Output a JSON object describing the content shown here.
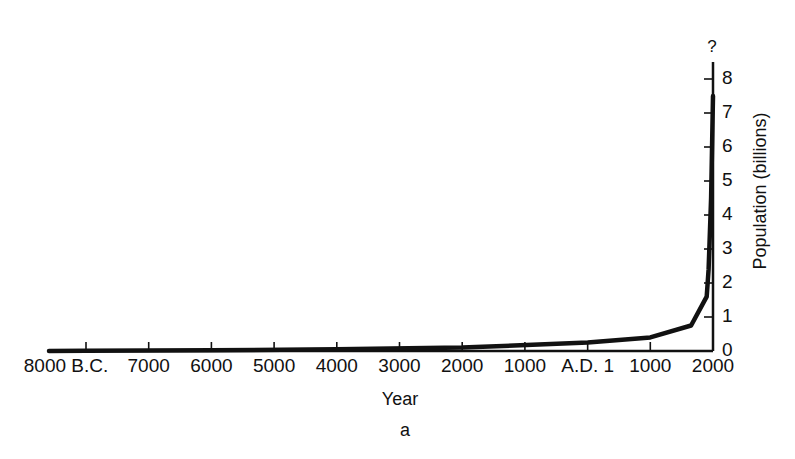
{
  "chart_data": {
    "type": "line",
    "title": "",
    "xlabel": "Year",
    "ylabel": "Population (billions)",
    "caption": "a",
    "annotation": "?",
    "x_tick_labels": [
      "8000 B.C.",
      "7000",
      "6000",
      "5000",
      "4000",
      "3000",
      "2000",
      "1000",
      "A.D. 1",
      "1000",
      "2000"
    ],
    "x_tick_values": [
      -8000,
      -7000,
      -6000,
      -5000,
      -4000,
      -3000,
      -2000,
      -1000,
      1,
      1000,
      2000
    ],
    "y_tick_labels": [
      "0",
      "1",
      "2",
      "3",
      "4",
      "5",
      "6",
      "7",
      "8"
    ],
    "ylim": [
      0,
      8.5
    ],
    "xlim": [
      -8600,
      2000
    ],
    "y_axis_position": "right",
    "grid": false,
    "legend": null,
    "series": [
      {
        "name": "World population",
        "x": [
          -8600,
          -8000,
          -6000,
          -4000,
          -2000,
          1,
          1000,
          1650,
          1900,
          1930,
          1970,
          2000
        ],
        "y": [
          0.0,
          0.005,
          0.02,
          0.05,
          0.1,
          0.25,
          0.4,
          0.75,
          1.6,
          2.4,
          4.5,
          7.5
        ]
      }
    ]
  },
  "labels": {
    "xlabel": "Year",
    "ylabel": "Population (billions)",
    "caption": "a",
    "question": "?"
  }
}
